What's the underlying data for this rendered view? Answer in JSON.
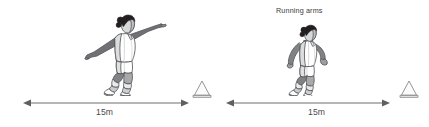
{
  "diagram": {
    "type": "sprint-drill-two-panel",
    "background_color": "#ffffff",
    "panels": [
      {
        "id": "left",
        "caption": "",
        "figure": {
          "name": "athlete-wide-arms",
          "pose_description": "Athlete running with arms stretched out wide to the sides",
          "arm_style": "wide arms"
        },
        "measure": {
          "label": "15m",
          "value": 15,
          "unit": "m",
          "arrow_style": "double-headed"
        },
        "marker": {
          "name": "cone",
          "shape": "triangle"
        }
      },
      {
        "id": "right",
        "caption": "Running arms",
        "figure": {
          "name": "athlete-running-arms",
          "pose_description": "Athlete sprinting with correct bent-elbow running arm action",
          "arm_style": "running arms"
        },
        "measure": {
          "label": "15m",
          "value": 15,
          "unit": "m",
          "arrow_style": "double-headed"
        },
        "marker": {
          "name": "cone",
          "shape": "triangle"
        }
      }
    ]
  },
  "colors": {
    "line": "#6e6e6e",
    "caption_text": "#3b3b3b",
    "label_text": "#4a4a4a",
    "figure_outline": "#58595b",
    "figure_shade_dark": "#808285",
    "figure_shade_mid": "#a7a9ac",
    "figure_shade_light": "#e6e7e8",
    "figure_white": "#ffffff",
    "hair": "#231f20",
    "cone_outline": "#8a8a8a",
    "cone_fill": "#f4f4f4"
  }
}
